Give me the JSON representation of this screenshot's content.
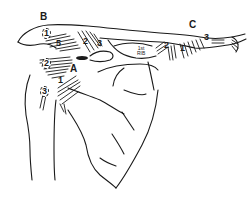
{
  "figure": {
    "region_labels": {
      "A": "A",
      "B": "B",
      "C": "C"
    },
    "attachment_labels": {
      "b1": "1",
      "b5": "5",
      "b2_upper": "2",
      "b3_upper": "3",
      "a2": "2",
      "a1": "1",
      "a3": "3",
      "rib_label_line1": "1st",
      "rib_label_line2": "RIB",
      "c2": "2",
      "c1": "1",
      "c3": "3"
    },
    "colors": {
      "line": "#1a1a1a",
      "background": "#ffffff"
    }
  }
}
